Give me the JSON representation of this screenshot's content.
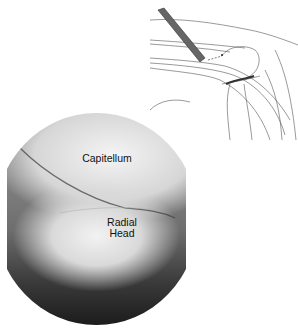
{
  "figure": {
    "labels": {
      "capitellum": "Capitellum",
      "radial_head_line1": "Radial",
      "radial_head_line2": "Head"
    },
    "panels": [
      {
        "type": "line-drawing",
        "subject": "elbow arthroscopy portal with instrument"
      },
      {
        "type": "arthroscopic-view",
        "subject": "capitellum and radial head"
      }
    ]
  }
}
